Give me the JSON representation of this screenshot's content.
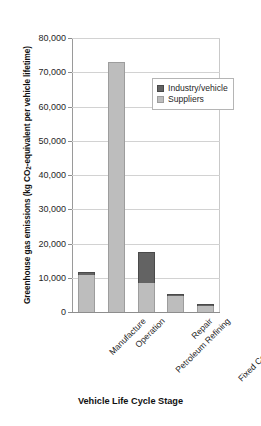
{
  "chart_data": {
    "type": "bar",
    "subtype": "stacked-column",
    "title": "",
    "xlabel": "Vehicle Life Cycle Stage",
    "ylabel": "Greenhouse gas emissions (kg CO2-equivalent per vehicle lifetime)",
    "categories": [
      "Manufacture",
      "Operation",
      "Petroleum Refining",
      "Repair",
      "Fixed Costs/Insurance"
    ],
    "series": [
      {
        "name": "Suppliers",
        "color": "#bdbdbd",
        "values": [
          10800,
          73000,
          8600,
          4700,
          1900
        ]
      },
      {
        "name": "Industry/vehicle",
        "color": "#636363",
        "values": [
          800,
          0,
          8900,
          400,
          300
        ]
      }
    ],
    "totals": [
      11600,
      73000,
      17500,
      5100,
      2200
    ],
    "ylim": [
      0,
      80000
    ],
    "yticks": [
      0,
      10000,
      20000,
      30000,
      40000,
      50000,
      60000,
      70000,
      80000
    ],
    "ytick_labels": [
      "0",
      "10,000",
      "20,000",
      "30,000",
      "40,000",
      "50,000",
      "60,000",
      "70,000",
      "80,000"
    ],
    "grid": true,
    "legend_position": "inside-upper-right",
    "legend_entries": [
      "Industry/vehicle",
      "Suppliers"
    ]
  },
  "axis": {
    "y_title_prefix": "Greenhouse gas emissions (kg CO",
    "y_title_sub": "2",
    "y_title_suffix": "-equivalent per vehicle lifetime)",
    "x_title": "Vehicle Life Cycle Stage"
  },
  "legend": {
    "items": [
      {
        "label": "Industry/vehicle",
        "color": "#636363"
      },
      {
        "label": "Suppliers",
        "color": "#bdbdbd"
      }
    ]
  },
  "colors": {
    "industry": "#636363",
    "suppliers": "#bdbdbd",
    "gridline": "#d2d2d2",
    "axis": "#8d8d8d",
    "text": "#1f1f1f",
    "background": "#ffffff"
  }
}
